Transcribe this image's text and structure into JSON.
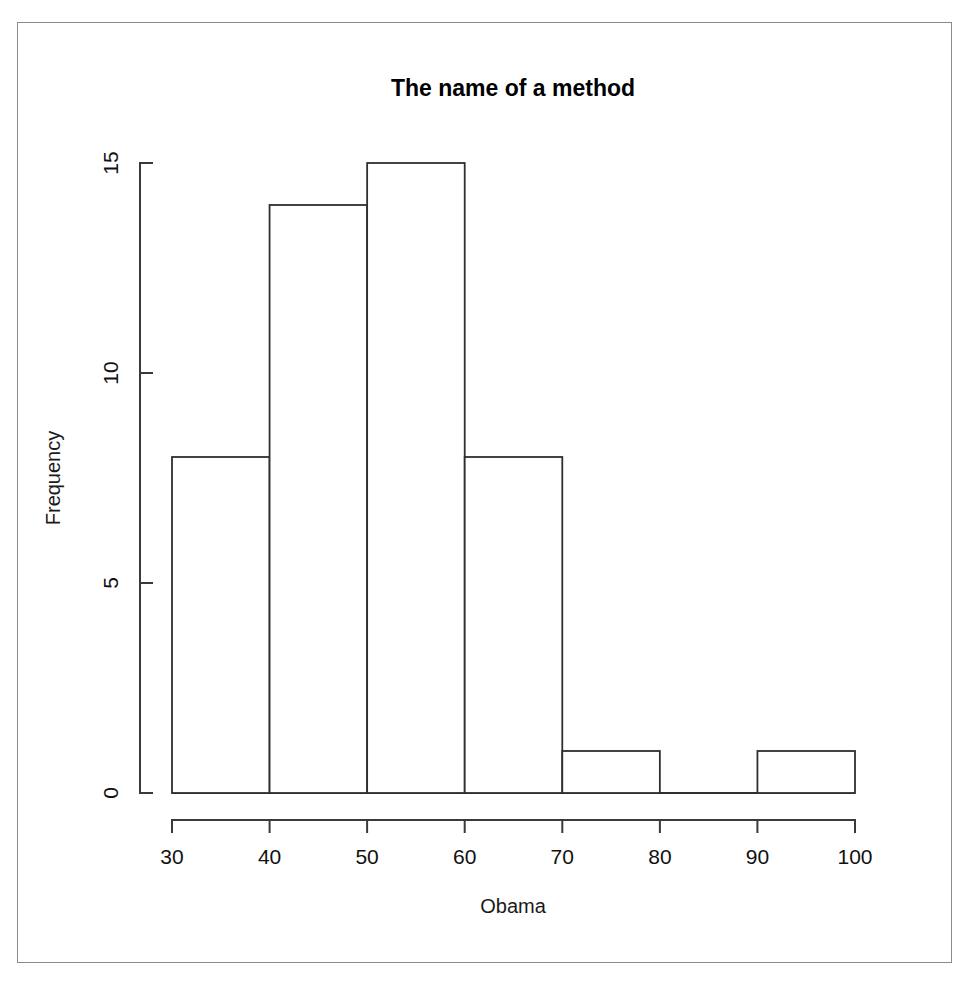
{
  "figure": {
    "title": "The name of a method",
    "background_color": "#ffffff",
    "border_color": "#8a8a8a",
    "line_color": "#2f2f2f"
  },
  "chart_data": {
    "type": "bar",
    "title": "The name of a method",
    "xlabel": "Obama",
    "ylabel": "Frequency",
    "categories": [
      "30-40",
      "40-50",
      "50-60",
      "60-70",
      "70-80",
      "80-90",
      "90-100"
    ],
    "bin_edges": [
      30,
      40,
      50,
      60,
      70,
      80,
      90,
      100
    ],
    "values": [
      8,
      14,
      15,
      8,
      1,
      0,
      1
    ],
    "bin_width": 10,
    "xlim": [
      30,
      100
    ],
    "ylim": [
      0,
      15
    ],
    "xticks": [
      30,
      40,
      50,
      60,
      70,
      80,
      90,
      100
    ],
    "xtick_labels": [
      "30",
      "40",
      "50",
      "60",
      "70",
      "80",
      "90",
      "100"
    ],
    "yticks": [
      0,
      5,
      10,
      15
    ],
    "ytick_labels": [
      "0",
      "5",
      "10",
      "15"
    ],
    "grid": false,
    "legend": false,
    "bar_fill": "#ffffff",
    "bar_stroke": "#2f2f2f",
    "total_count": 47
  }
}
